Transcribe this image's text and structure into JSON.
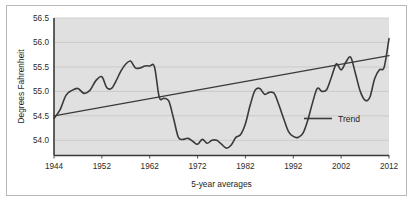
{
  "chart_data": {
    "type": "line",
    "title": "",
    "subtitle": "",
    "xlabel": "5-year averages",
    "ylabel": "Degrees Fahrenheit",
    "xlim": [
      1944,
      2012
    ],
    "ylim": [
      53.7,
      56.5
    ],
    "yticks": [
      "54.0",
      "54.5",
      "55.0",
      "55.5",
      "56.0",
      "56.5"
    ],
    "ytick_values": [
      54.0,
      54.5,
      55.0,
      55.5,
      56.0,
      56.5
    ],
    "xticks": [
      "1944",
      "1952",
      "1962",
      "1972",
      "1982",
      "1992",
      "2002",
      "2012"
    ],
    "xtick_values": [
      1944,
      1952,
      1962,
      1972,
      1982,
      1992,
      2002,
      2012
    ],
    "grid": "horizontal",
    "legend_position": "inside-right",
    "plot_background": "#e0e0e0",
    "line_color": "#3a3a3a",
    "series": [
      {
        "name": "5-year average temperature",
        "in_legend": false,
        "x": [
          1944,
          1945,
          1946,
          1947,
          1948,
          1949,
          1950,
          1951,
          1952,
          1953,
          1954,
          1955,
          1956,
          1957,
          1958,
          1959,
          1960,
          1961,
          1962,
          1963,
          1964,
          1965,
          1966,
          1967,
          1968,
          1969,
          1970,
          1971,
          1972,
          1973,
          1974,
          1975,
          1976,
          1977,
          1978,
          1979,
          1980,
          1981,
          1982,
          1983,
          1984,
          1985,
          1986,
          1987,
          1988,
          1989,
          1990,
          1991,
          1992,
          1993,
          1994,
          1995,
          1996,
          1997,
          1998,
          1999,
          2000,
          2001,
          2002,
          2003,
          2004,
          2005,
          2006,
          2007,
          2008,
          2009,
          2010,
          2011,
          2012
        ],
        "values": [
          54.45,
          54.62,
          54.92,
          55.02,
          55.06,
          54.96,
          55.02,
          55.22,
          55.3,
          55.08,
          55.06,
          55.22,
          55.42,
          55.56,
          55.62,
          55.48,
          55.48,
          55.52,
          55.52,
          55.5,
          54.88,
          54.86,
          54.8,
          54.44,
          54.06,
          54.02,
          54.04,
          53.98,
          53.92,
          54.02,
          53.94,
          54.0,
          54.0,
          53.92,
          53.84,
          53.9,
          54.06,
          54.12,
          54.34,
          54.72,
          55.02,
          55.06,
          54.94,
          54.98,
          54.96,
          54.72,
          54.44,
          54.18,
          54.08,
          54.06,
          54.14,
          54.4,
          54.76,
          55.06,
          55.0,
          55.04,
          55.3,
          55.56,
          55.44,
          55.6,
          55.7,
          55.36,
          55.0,
          54.82,
          54.88,
          55.26,
          55.44,
          55.5,
          56.08
        ]
      },
      {
        "name": "Trend",
        "in_legend": true,
        "x": [
          1944,
          2012
        ],
        "values": [
          54.5,
          55.73
        ]
      }
    ],
    "annotations": []
  },
  "legend": {
    "items": [
      {
        "label": "Trend",
        "color": "#3a3a3a"
      }
    ]
  }
}
